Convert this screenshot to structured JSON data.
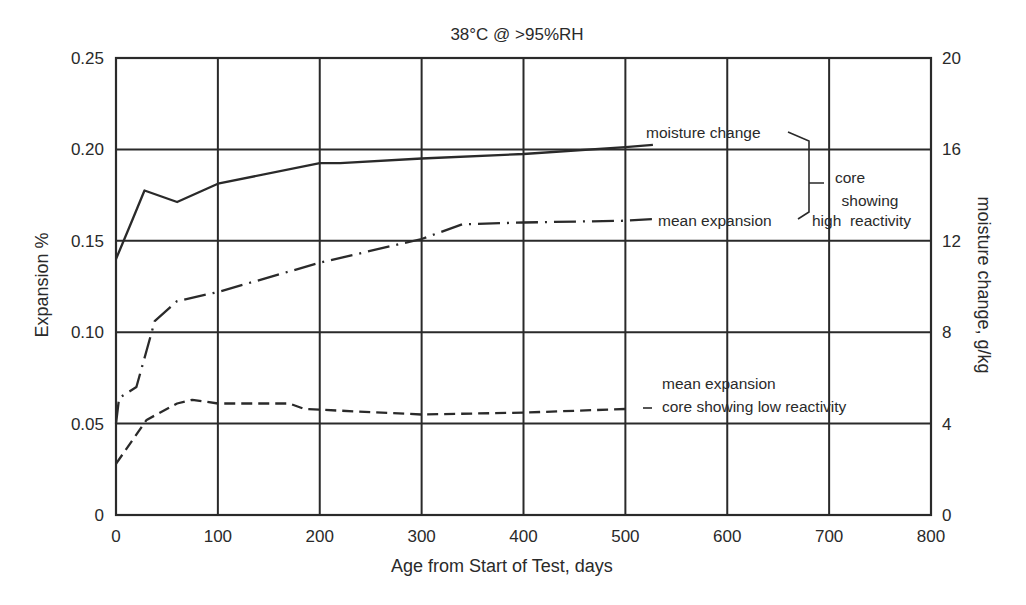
{
  "chart_data": {
    "type": "line",
    "title": "38°C @ >95%RH",
    "xlabel": "Age from Start of Test, days",
    "ylabel": "Expansion %",
    "y2label": "moisture change, g/kg",
    "xlim": [
      0,
      800
    ],
    "ylim": [
      0,
      0.25
    ],
    "y2lim": [
      0,
      20
    ],
    "grid": true,
    "legend_position": "inline annotations",
    "x_ticks": [
      "0",
      "100",
      "200",
      "300",
      "400",
      "500",
      "600",
      "700",
      "800"
    ],
    "y_ticks": [
      "0",
      "0.05",
      "0.10",
      "0.15",
      "0.20",
      "0.25"
    ],
    "y2_ticks": [
      "0",
      "4",
      "8",
      "12",
      "16",
      "20"
    ],
    "series": [
      {
        "name": "moisture change (core showing high reactivity)",
        "axis": "right",
        "style": "solid",
        "x": [
          0,
          15,
          28,
          60,
          100,
          200,
          220,
          300,
          400,
          500,
          527
        ],
        "values": [
          11.2,
          12.8,
          14.2,
          13.7,
          14.5,
          15.4,
          15.4,
          15.6,
          15.8,
          16.1,
          16.2
        ]
      },
      {
        "name": "mean expansion (core showing high reactivity)",
        "axis": "left",
        "style": "dash-dot",
        "x": [
          0,
          3,
          20,
          30,
          38,
          60,
          100,
          200,
          300,
          340,
          400,
          500,
          530
        ],
        "values": [
          0.05,
          0.064,
          0.07,
          0.09,
          0.106,
          0.117,
          0.122,
          0.138,
          0.151,
          0.159,
          0.16,
          0.161,
          0.162
        ]
      },
      {
        "name": "mean expansion core showing low reactivity",
        "axis": "left",
        "style": "dashed",
        "x": [
          0,
          30,
          60,
          75,
          100,
          170,
          185,
          300,
          400,
          500
        ],
        "values": [
          0.028,
          0.052,
          0.061,
          0.063,
          0.061,
          0.061,
          0.058,
          0.055,
          0.056,
          0.058
        ]
      }
    ],
    "annotations": {
      "moisture": "moisture change",
      "high_expansion": "mean expansion",
      "high_group": [
        "core",
        "showing",
        "high  reactivity"
      ],
      "low_line1": "mean expansion",
      "low_line2": "core showing low reactivity"
    }
  }
}
